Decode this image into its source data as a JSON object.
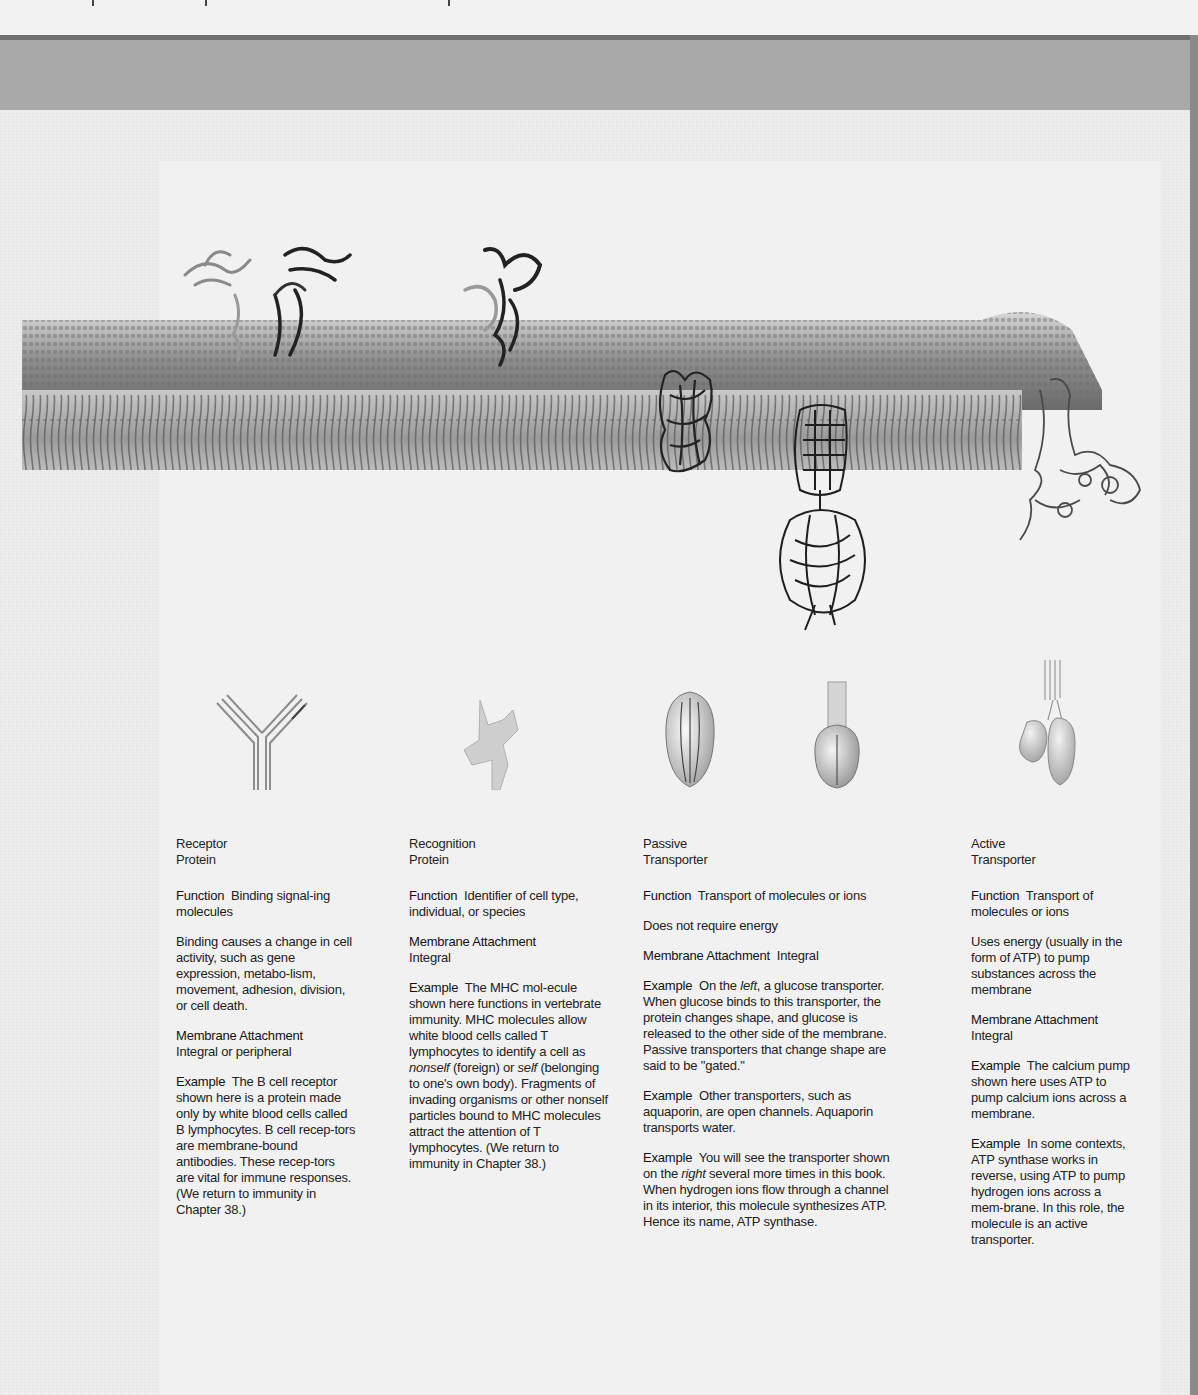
{
  "page": {
    "header_band_color": "#a9a9a9",
    "header_rule_color": "#6f6f6f",
    "background_color": "#ededed"
  },
  "figure": {
    "membrane_label": "lipid bilayer with embedded proteins",
    "proteins": [
      {
        "name": "receptor-protein-structure"
      },
      {
        "name": "recognition-protein-structure"
      },
      {
        "name": "passive-transporter-glucose-structure"
      },
      {
        "name": "passive-transporter-atp-synthase-structure"
      },
      {
        "name": "active-transporter-calcium-pump-structure"
      }
    ]
  },
  "columns": [
    {
      "title_line1": "Receptor",
      "title_line2": "Protein",
      "function_label": "Function",
      "function_text": "Binding signal-ing molecules",
      "note": "Binding causes a change in cell activity, such as gene expression, metabo-lism, movement, adhesion, division, or cell death.",
      "attachment_label": "Membrane Attachment",
      "attachment_text": "Integral or peripheral",
      "examples": [
        {
          "label": "Example",
          "text": "The B cell receptor shown here is a protein made only by white blood cells called B lymphocytes. B cell recep-tors are membrane-bound antibodies. These recep-tors are vital for immune responses. (We return to immunity in Chapter 38.)"
        }
      ]
    },
    {
      "title_line1": "Recognition",
      "title_line2": "Protein",
      "function_label": "Function",
      "function_text": "Identifier of cell type, individual, or species",
      "attachment_label": "Membrane Attachment",
      "attachment_text": "Integral",
      "examples": [
        {
          "label": "Example",
          "text_before_nonself": "The MHC mol-ecule shown here functions in vertebrate immunity. MHC molecules allow white blood cells called T lymphocytes to identify a cell as ",
          "nonself": "nonself",
          "text_mid": " (foreign) or ",
          "self": "self",
          "text_after": " (belonging to one's own body). Fragments of invading organisms or other nonself particles bound to MHC molecules attract the attention of T lymphocytes. (We return to immunity in Chapter 38.)"
        }
      ]
    },
    {
      "title_line1": "Passive",
      "title_line2": "Transporter",
      "function_label": "Function",
      "function_text": "Transport of molecules or ions",
      "note": "Does not require energy",
      "attachment_label": "Membrane Attachment",
      "attachment_text": "Integral",
      "examples": [
        {
          "label": "Example",
          "text_before": "On the ",
          "emph": "left",
          "text_after": ", a glucose transporter. When glucose binds to this transporter, the protein changes shape, and glucose is released to the other side of the membrane. Passive transporters that change shape are said to be \"gated.\""
        },
        {
          "label": "Example",
          "text": "Other transporters, such as aquaporin, are open channels. Aquaporin transports water."
        },
        {
          "label": "Example",
          "text_before": "You will see the transporter shown on the ",
          "emph": "right",
          "text_after": " several more times in this book. When hydrogen ions flow through a channel in its interior, this molecule synthesizes ATP. Hence its name, ATP synthase."
        }
      ]
    },
    {
      "title_line1": "Active",
      "title_line2": "Transporter",
      "function_label": "Function",
      "function_text": "Transport of molecules or ions",
      "note": "Uses energy (usually in the form of ATP) to pump substances across the membrane",
      "attachment_label": "Membrane Attachment",
      "attachment_text": "Integral",
      "examples": [
        {
          "label": "Example",
          "text": "The calcium pump shown here uses ATP to pump calcium ions across a membrane."
        },
        {
          "label": "Example",
          "text": "In some contexts, ATP synthase works in reverse, using ATP to pump hydrogen ions across a mem-brane. In this role, the molecule is an active transporter."
        }
      ]
    }
  ]
}
